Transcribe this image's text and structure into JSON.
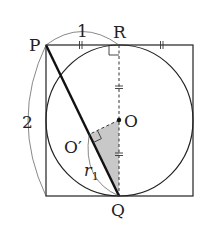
{
  "diagram": {
    "type": "geometry",
    "labels": {
      "P": "P",
      "R": "R",
      "O": "O",
      "O_prime": "O′",
      "Q": "Q",
      "top_length": "1",
      "side_length": "2",
      "radius_r": "r",
      "radius_sub": "1"
    },
    "colors": {
      "stroke": "#222222",
      "shaded": "#c8c8c8",
      "background": "#ffffff"
    },
    "marks": {
      "equal_ticks": "||",
      "right_angles": [
        "R",
        "O′"
      ]
    }
  }
}
